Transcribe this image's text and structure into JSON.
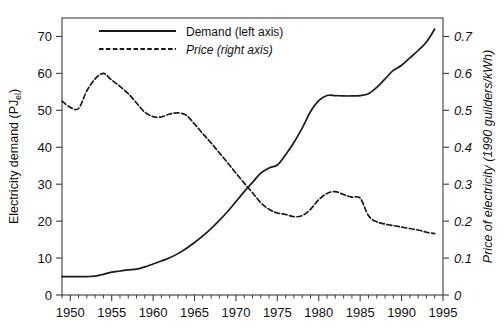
{
  "chart_data": {
    "type": "line",
    "title": "",
    "xlabel": "",
    "ylabel": "Electricity demand (PJ_el)",
    "ylabel_main": "Electricity demand (PJ",
    "ylabel_sub": "el",
    "ylabel_tail": ")",
    "y2label": "Price of electricity (1990 guilders/kWh)",
    "xlim": [
      1949,
      1995
    ],
    "ylim": [
      0,
      75
    ],
    "y2lim": [
      0,
      0.75
    ],
    "grid": false,
    "legend_position": "top-left inside",
    "x_ticks_major": [
      1950,
      1955,
      1960,
      1965,
      1970,
      1975,
      1980,
      1985,
      1990,
      1995
    ],
    "x_tick_labels": [
      "1950",
      "1955",
      "1960",
      "1965",
      "1970",
      "1975",
      "1980",
      "1985",
      "1990",
      "1995"
    ],
    "x_minor_tick_interval": 1,
    "y_ticks": [
      0,
      10,
      20,
      30,
      40,
      50,
      60,
      70
    ],
    "y_tick_labels": [
      "0",
      "10",
      "20",
      "30",
      "40",
      "50",
      "60",
      "70"
    ],
    "y2_ticks": [
      0,
      0.1,
      0.2,
      0.3,
      0.4,
      0.5,
      0.6,
      0.7
    ],
    "y2_tick_labels": [
      "0",
      "0.1",
      "0.2",
      "0.3",
      "0.4",
      "0.5",
      "0.6",
      "0.7"
    ],
    "legend": [
      {
        "label": "Demand (left axis)",
        "style": "solid",
        "italic": false
      },
      {
        "label": "Price (right axis)",
        "style": "dashed",
        "italic": true
      }
    ],
    "series": [
      {
        "name": "Demand (left axis)",
        "axis": "left",
        "style": "solid",
        "units": "PJ_el",
        "x": [
          1949,
          1950,
          1951,
          1952,
          1953,
          1954,
          1955,
          1956,
          1957,
          1958,
          1959,
          1960,
          1961,
          1962,
          1963,
          1964,
          1965,
          1966,
          1967,
          1968,
          1969,
          1970,
          1971,
          1972,
          1973,
          1974,
          1975,
          1976,
          1977,
          1978,
          1979,
          1980,
          1981,
          1982,
          1983,
          1984,
          1985,
          1986,
          1987,
          1988,
          1989,
          1990,
          1991,
          1992,
          1993,
          1994
        ],
        "values": [
          5.0,
          5.0,
          5.0,
          5.0,
          5.1,
          5.6,
          6.2,
          6.5,
          6.8,
          7.0,
          7.6,
          8.4,
          9.2,
          10.1,
          11.2,
          12.6,
          14.2,
          16.0,
          18.0,
          20.2,
          22.6,
          25.3,
          28.0,
          30.5,
          33.0,
          34.4,
          35.2,
          38.0,
          41.3,
          45.2,
          49.6,
          52.6,
          54.0,
          54.0,
          53.9,
          53.9,
          54.0,
          54.5,
          56.2,
          58.5,
          60.8,
          62.2,
          64.2,
          66.2,
          68.5,
          72.0
        ]
      },
      {
        "name": "Price (right axis)",
        "axis": "right",
        "style": "dashed",
        "units": "1990 guilders/kWh",
        "x": [
          1949,
          1950,
          1951,
          1952,
          1953,
          1954,
          1955,
          1956,
          1957,
          1958,
          1959,
          1960,
          1961,
          1962,
          1963,
          1964,
          1965,
          1966,
          1967,
          1968,
          1969,
          1970,
          1971,
          1972,
          1973,
          1974,
          1975,
          1976,
          1977,
          1978,
          1979,
          1980,
          1981,
          1982,
          1983,
          1984,
          1985,
          1986,
          1987,
          1988,
          1989,
          1990,
          1991,
          1992,
          1993,
          1994
        ],
        "values": [
          0.525,
          0.508,
          0.505,
          0.553,
          0.585,
          0.6,
          0.582,
          0.565,
          0.545,
          0.52,
          0.495,
          0.483,
          0.482,
          0.49,
          0.493,
          0.487,
          0.463,
          0.437,
          0.412,
          0.385,
          0.358,
          0.33,
          0.303,
          0.277,
          0.25,
          0.232,
          0.222,
          0.218,
          0.212,
          0.215,
          0.232,
          0.258,
          0.275,
          0.28,
          0.272,
          0.265,
          0.262,
          0.215,
          0.198,
          0.192,
          0.188,
          0.184,
          0.18,
          0.176,
          0.17,
          0.166
        ]
      }
    ]
  },
  "plot": {
    "left_px": 62,
    "right_px": 443,
    "top_px": 18,
    "bottom_px": 295
  }
}
